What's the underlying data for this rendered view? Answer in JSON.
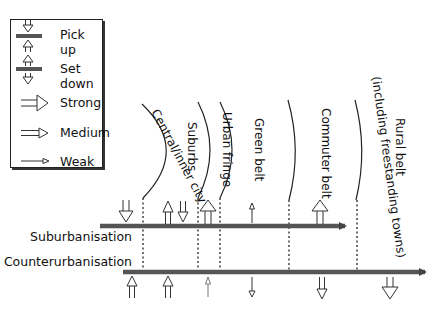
{
  "legend": {
    "items": [
      {
        "key": "pick_up",
        "label": "Pick up"
      },
      {
        "key": "set_down",
        "label": "Set down"
      },
      {
        "key": "strong",
        "label": "Strong"
      },
      {
        "key": "medium",
        "label": "Medium"
      },
      {
        "key": "weak",
        "label": "Weak"
      }
    ]
  },
  "zones": [
    {
      "label": "Central/inner city"
    },
    {
      "label": "Suburbs"
    },
    {
      "label": "Urban fringe"
    },
    {
      "label": "Green belt"
    },
    {
      "label": "Commuter belt"
    },
    {
      "label": "Rural belt"
    },
    {
      "label": "(including freestanding towns)"
    }
  ],
  "processes": {
    "suburbanisation": {
      "label": "Suburbanisation"
    },
    "counterurbanisation": {
      "label": "Counterurbanisation"
    }
  },
  "flows": {
    "suburbanisation": [
      {
        "zone": "Central/inner city",
        "direction": "down",
        "strength": "medium"
      },
      {
        "zone": "Suburbs",
        "direction": "up",
        "strength": "medium"
      },
      {
        "zone": "Suburbs",
        "direction": "down",
        "strength": "medium"
      },
      {
        "zone": "Urban fringe",
        "direction": "up",
        "strength": "strong"
      },
      {
        "zone": "Green belt",
        "direction": "up",
        "strength": "weak"
      },
      {
        "zone": "Commuter belt",
        "direction": "up",
        "strength": "strong"
      }
    ],
    "counterurbanisation": [
      {
        "zone": "Central/inner city",
        "direction": "up",
        "strength": "medium"
      },
      {
        "zone": "Suburbs",
        "direction": "up",
        "strength": "medium"
      },
      {
        "zone": "Urban fringe",
        "direction": "up",
        "strength": "weak"
      },
      {
        "zone": "Green belt",
        "direction": "down",
        "strength": "weak"
      },
      {
        "zone": "Commuter belt",
        "direction": "down",
        "strength": "medium"
      },
      {
        "zone": "Rural belt",
        "direction": "down",
        "strength": "strong"
      }
    ]
  },
  "colors": {
    "bar": "#555555",
    "line": "#222222",
    "weak_arrow": "#777777"
  }
}
